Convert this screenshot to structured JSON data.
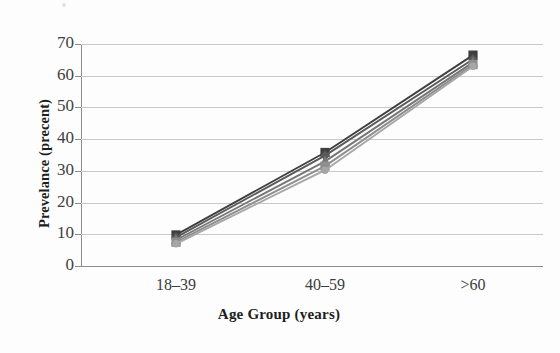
{
  "chart_data": {
    "type": "line",
    "title": "",
    "xlabel": "Age Group (years)",
    "ylabel": "Prevelance (precent)",
    "categories": [
      "18–39",
      "40–59",
      ">60"
    ],
    "ylim": [
      0,
      70
    ],
    "ytick_values": [
      0,
      10,
      20,
      30,
      40,
      50,
      60,
      70
    ],
    "ytick_labels": [
      "0",
      "10",
      "20",
      "30",
      "40",
      "50",
      "60",
      "70"
    ],
    "grid": "horizontal",
    "legend": "none",
    "series": [
      {
        "name": "series-1",
        "color": "#3f3f3f",
        "marker": "square",
        "values": [
          9.8,
          35.8,
          66.5
        ]
      },
      {
        "name": "series-2",
        "color": "#5a5a5a",
        "marker": "diamond",
        "values": [
          9.0,
          34.8,
          65.2
        ]
      },
      {
        "name": "series-3",
        "color": "#767676",
        "marker": "triangle",
        "values": [
          8.2,
          33.0,
          64.2
        ]
      },
      {
        "name": "series-4",
        "color": "#8e8e8e",
        "marker": "square",
        "values": [
          7.5,
          31.5,
          63.5
        ]
      },
      {
        "name": "series-5",
        "color": "#a6a6a6",
        "marker": "circle",
        "values": [
          7.0,
          30.2,
          63.0
        ]
      }
    ]
  },
  "axis": {
    "ytitle": "Prevelance (precent)",
    "xtitle": "Age Group (years)"
  }
}
